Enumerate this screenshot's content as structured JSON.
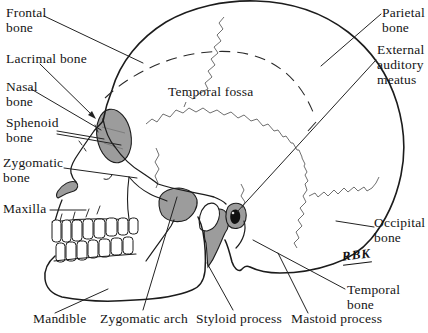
{
  "figure": {
    "type": "anatomical-line-diagram"
  },
  "labels": {
    "frontal": "Frontal\nbone",
    "lacrimal": "Lacrimal bone",
    "nasal": "Nasal\nbone",
    "sphenoid": "Sphenoid\nbone",
    "zygomatic": "Zygomatic\nbone",
    "maxilla": "Maxilla",
    "mandible": "Mandible",
    "zygomatic_arch": "Zygomatic arch",
    "styloid": "Styloid process",
    "mastoid": "Mastoid process",
    "temporal": "Temporal bone",
    "occipital": "Occipital\nbone",
    "external_auditory_meatus": "External\nauditory\nmeatus",
    "parietal": "Parietal\nbone",
    "temporal_fossa": "Temporal fossa",
    "signature": "RBK"
  },
  "colors": {
    "background": "#ffffff",
    "line": "#1c1c1c",
    "shade": "#9c9c9c",
    "text": "#151515"
  }
}
